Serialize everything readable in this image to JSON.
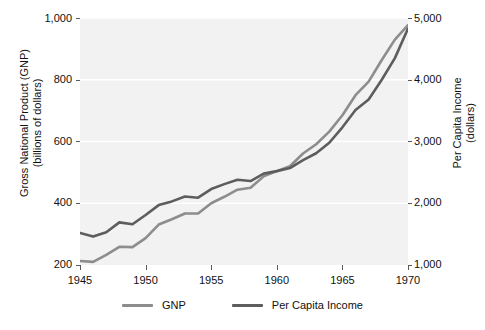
{
  "chart_data": {
    "type": "line",
    "title": "",
    "xlabel": "",
    "ylabel": "Gross National Product (GNP)\n(billions of dollars)",
    "y2label": "Per Capita Income\n(dollars)",
    "grid": true,
    "legend_position": "bottom-center",
    "xlim": [
      1945,
      1970
    ],
    "ylim": [
      200,
      1000
    ],
    "y2lim": [
      1000,
      5000
    ],
    "xticks": [
      "1945",
      "1950",
      "1955",
      "1960",
      "1965",
      "1970"
    ],
    "yticks": [
      "200",
      "400",
      "600",
      "800",
      "1,000"
    ],
    "y2ticks": [
      "1,000",
      "2,000",
      "3,000",
      "4,000",
      "5,000"
    ],
    "x": [
      1945,
      1946,
      1947,
      1948,
      1949,
      1950,
      1951,
      1952,
      1953,
      1954,
      1955,
      1956,
      1957,
      1958,
      1959,
      1960,
      1961,
      1962,
      1963,
      1964,
      1965,
      1966,
      1967,
      1968,
      1969,
      1970
    ],
    "series": [
      {
        "name": "GNP",
        "axis": "left",
        "color": "#8d8d8d",
        "values": [
          213,
          210,
          233,
          259,
          258,
          287,
          331,
          348,
          367,
          367,
          400,
          421,
          444,
          450,
          487,
          504,
          520,
          561,
          591,
          632,
          685,
          750,
          794,
          864,
          930,
          977
        ]
      },
      {
        "name": "Per Capita Income",
        "axis": "right",
        "color": "#5d5d5d",
        "values": [
          1520,
          1460,
          1530,
          1690,
          1660,
          1810,
          1970,
          2030,
          2110,
          2090,
          2230,
          2310,
          2380,
          2360,
          2480,
          2520,
          2570,
          2700,
          2810,
          2980,
          3230,
          3510,
          3680,
          4000,
          4350,
          4830
        ]
      }
    ],
    "legend": [
      {
        "label": "GNP",
        "color": "#8d8d8d"
      },
      {
        "label": "Per Capita Income",
        "color": "#5d5d5d"
      }
    ],
    "colors": {
      "plot_background": "#f2f2f2",
      "gridline": "#ffffff",
      "text": "#111111",
      "page_background": "#ffffff"
    }
  }
}
